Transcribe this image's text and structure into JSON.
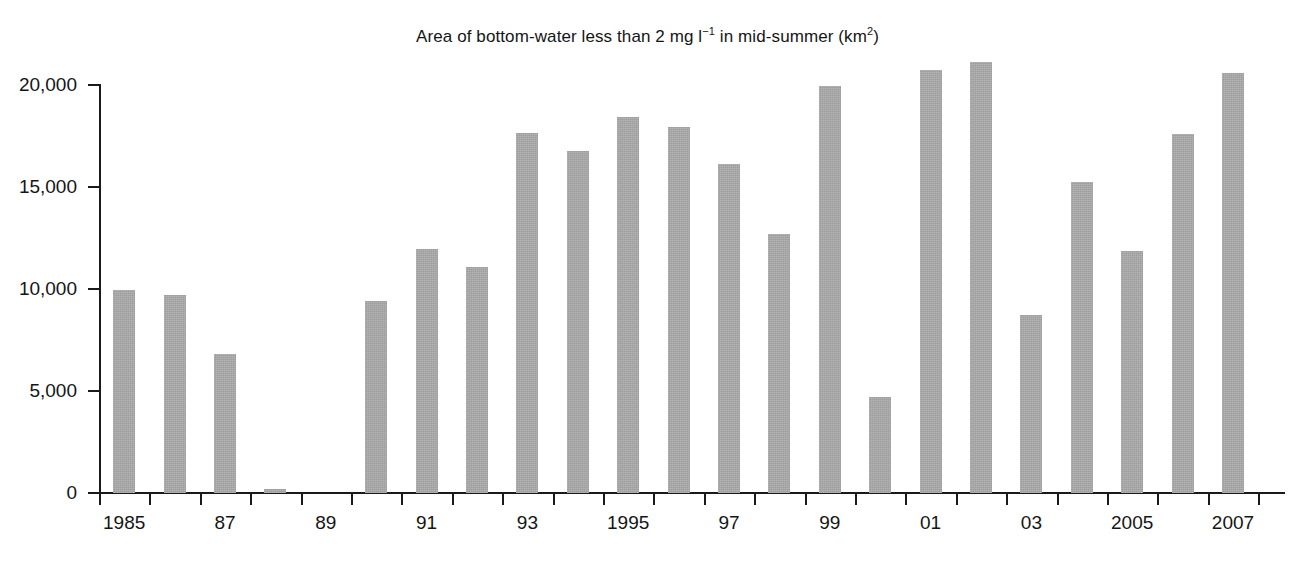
{
  "chart_data": {
    "type": "bar",
    "title": "Area of bottom-water less than 2 mg l−1 in mid-summer (km2)",
    "title_parts": {
      "before_sup1": "Area of bottom-water less than 2 mg l",
      "sup1": "−1",
      "between": " in mid-summer (km",
      "sup2": "2",
      "after": ")"
    },
    "xlabel": "",
    "ylabel": "",
    "ylim": [
      0,
      21600
    ],
    "grid": false,
    "legend": false,
    "bar_color": "#9d9d9d",
    "axis_color": "#1a1a1a",
    "ytick_labels": [
      "0",
      "5,000",
      "10,000",
      "15,000",
      "20,000"
    ],
    "ytick_values": [
      0,
      5000,
      10000,
      15000,
      20000
    ],
    "xtick_labels": [
      "1985",
      "",
      "87",
      "",
      "89",
      "",
      "91",
      "",
      "93",
      "",
      "1995",
      "",
      "97",
      "",
      "99",
      "",
      "01",
      "",
      "03",
      "",
      "2005",
      "",
      "2007"
    ],
    "categories": [
      "1985",
      "1986",
      "1987",
      "1988",
      "1989",
      "1990",
      "1991",
      "1992",
      "1993",
      "1994",
      "1995",
      "1996",
      "1997",
      "1998",
      "1999",
      "2000",
      "2001",
      "2002",
      "2003",
      "2004",
      "2005",
      "2006",
      "2007"
    ],
    "values": [
      9950,
      9700,
      6800,
      200,
      null,
      9400,
      11950,
      11100,
      17650,
      16750,
      18450,
      17950,
      16150,
      12700,
      19950,
      4700,
      20750,
      21150,
      8750,
      15250,
      11850,
      17600,
      20600
    ],
    "annotations": [
      {
        "text": "No data",
        "category": "1989",
        "rotation": -90
      }
    ]
  }
}
